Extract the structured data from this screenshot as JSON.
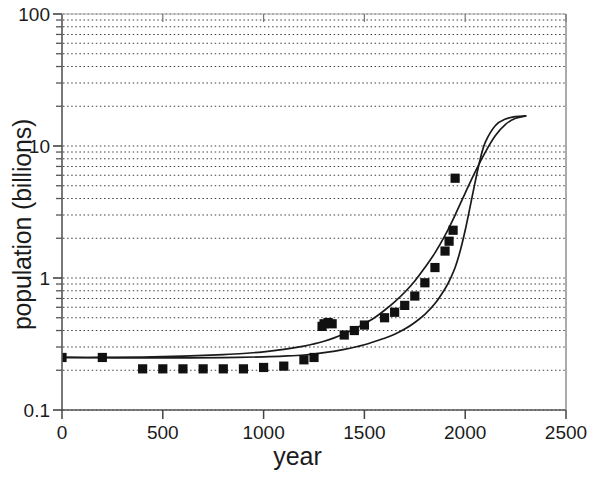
{
  "chart_data": {
    "type": "line",
    "title": "",
    "xlabel": "year",
    "ylabel": "population (billions)",
    "yscale": "log",
    "xscale": "linear",
    "xlim": [
      0,
      2500
    ],
    "ylim": [
      0.1,
      100
    ],
    "grid": true,
    "grid_style": "dotted horizontal minor log gridlines",
    "legend": "none",
    "xticks": [
      0,
      500,
      1000,
      1500,
      2000,
      2500
    ],
    "xticklabels": [
      "0",
      "500",
      "1000",
      "1500",
      "2000",
      "2500"
    ],
    "yticks": [
      0.1,
      1,
      10,
      100
    ],
    "yticklabels": [
      "0.1",
      "1",
      "10",
      "100"
    ],
    "yminorticks": [
      0.2,
      0.3,
      0.4,
      0.5,
      0.6,
      0.7,
      0.8,
      0.9,
      2,
      3,
      4,
      5,
      6,
      7,
      8,
      9,
      20,
      30,
      40,
      50,
      60,
      70,
      80,
      90
    ],
    "series": [
      {
        "name": "upper projection curve",
        "style": "solid line",
        "marker": "none",
        "x": [
          0,
          200,
          400,
          600,
          800,
          900,
          1000,
          1100,
          1200,
          1250,
          1300,
          1350,
          1400,
          1450,
          1500,
          1550,
          1600,
          1650,
          1700,
          1750,
          1800,
          1850,
          1900,
          1950,
          2000,
          2050,
          2100,
          2150,
          2200,
          2250,
          2300
        ],
        "y": [
          0.25,
          0.25,
          0.252,
          0.256,
          0.263,
          0.268,
          0.276,
          0.288,
          0.305,
          0.317,
          0.332,
          0.352,
          0.378,
          0.41,
          0.45,
          0.5,
          0.57,
          0.66,
          0.78,
          0.95,
          1.2,
          1.55,
          2.1,
          3.0,
          4.4,
          6.4,
          9.0,
          12.0,
          14.6,
          16.2,
          16.9
        ]
      },
      {
        "name": "lower projection curve",
        "style": "solid line",
        "marker": "none",
        "x": [
          0,
          200,
          400,
          600,
          800,
          1000,
          1100,
          1200,
          1300,
          1400,
          1500,
          1600,
          1650,
          1700,
          1750,
          1800,
          1850,
          1900,
          1925,
          1950,
          1975,
          2000,
          2025,
          2050,
          2075,
          2100,
          2150,
          2200,
          2250,
          2300
        ],
        "y": [
          0.25,
          0.249,
          0.248,
          0.248,
          0.249,
          0.253,
          0.256,
          0.261,
          0.272,
          0.288,
          0.312,
          0.35,
          0.375,
          0.41,
          0.46,
          0.53,
          0.64,
          0.83,
          0.98,
          1.2,
          1.6,
          2.3,
          3.5,
          5.4,
          8.0,
          10.7,
          14.3,
          16.0,
          16.7,
          16.9
        ]
      },
      {
        "name": "historical population estimates",
        "style": "markers only",
        "marker": "filled square",
        "x": [
          0,
          200,
          400,
          500,
          600,
          700,
          800,
          900,
          1000,
          1100,
          1200,
          1250,
          1290,
          1300,
          1320,
          1340,
          1400,
          1450,
          1500,
          1600,
          1650,
          1700,
          1750,
          1800,
          1850,
          1900,
          1920,
          1940,
          1950
        ],
        "y": [
          0.25,
          0.25,
          0.205,
          0.205,
          0.205,
          0.205,
          0.205,
          0.205,
          0.21,
          0.215,
          0.24,
          0.25,
          0.43,
          0.45,
          0.46,
          0.45,
          0.37,
          0.4,
          0.44,
          0.5,
          0.55,
          0.62,
          0.73,
          0.92,
          1.2,
          1.6,
          1.9,
          2.3,
          5.7
        ]
      }
    ],
    "annotations": []
  },
  "axes": {
    "x_title": "year",
    "y_title": "population (billions)"
  }
}
